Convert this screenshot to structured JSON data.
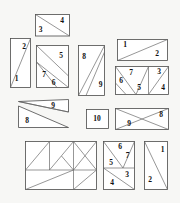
{
  "figure": {
    "background_color": "#f7f7f5",
    "piece_fill": "#ffffff",
    "piece_stroke": "#4a4a4a",
    "label_color": "#111111",
    "width": 180,
    "height": 203
  },
  "pieces": [
    {
      "id": "piece-3-4",
      "name": "rectangle-diagonal-3-4",
      "labels": [
        "3",
        "4"
      ],
      "label_positions": [
        {
          "x": 40,
          "y": 30
        },
        {
          "x": 62,
          "y": 21
        }
      ]
    },
    {
      "id": "piece-2-1",
      "name": "tall-rectangle-diagonal-2-1",
      "labels": [
        "2",
        "1"
      ],
      "label_positions": [
        {
          "x": 24,
          "y": 48
        },
        {
          "x": 16,
          "y": 80
        }
      ]
    },
    {
      "id": "piece-5-7-6",
      "name": "square-multi-cut-5-7-6",
      "labels": [
        "5",
        "7",
        "6"
      ],
      "label_positions": [
        {
          "x": 61,
          "y": 57
        },
        {
          "x": 44,
          "y": 75
        },
        {
          "x": 53,
          "y": 83
        }
      ]
    },
    {
      "id": "piece-8-9-tall",
      "name": "tall-rectangle-diagonal-8-9",
      "labels": [
        "8",
        "9"
      ],
      "label_positions": [
        {
          "x": 84,
          "y": 58
        },
        {
          "x": 101,
          "y": 85
        }
      ]
    },
    {
      "id": "piece-1-2-wide",
      "name": "wide-rectangle-diagonal-1-2",
      "labels": [
        "1",
        "2"
      ],
      "label_positions": [
        {
          "x": 125,
          "y": 45
        },
        {
          "x": 157,
          "y": 54
        }
      ]
    },
    {
      "id": "piece-6-7-5-3-4",
      "name": "wide-rectangle-multi-cut-6-7-5-3-4",
      "labels": [
        "7",
        "6",
        "5",
        "3",
        "4"
      ],
      "label_positions": [
        {
          "x": 131,
          "y": 73
        },
        {
          "x": 121,
          "y": 81
        },
        {
          "x": 139,
          "y": 88
        },
        {
          "x": 159,
          "y": 73
        },
        {
          "x": 163,
          "y": 88
        }
      ]
    },
    {
      "id": "piece-9-8-wide",
      "name": "wide-parallelogram-pair-9-8",
      "labels": [
        "9",
        "8"
      ],
      "label_positions": [
        {
          "x": 53,
          "y": 106
        },
        {
          "x": 27,
          "y": 122
        }
      ]
    },
    {
      "id": "piece-10",
      "name": "plain-rectangle-10",
      "labels": [
        "10"
      ],
      "label_positions": [
        {
          "x": 96,
          "y": 119
        }
      ]
    },
    {
      "id": "piece-9-8-cross",
      "name": "wide-rectangle-cross-9-8",
      "labels": [
        "9",
        "8"
      ],
      "label_positions": [
        {
          "x": 129,
          "y": 124
        },
        {
          "x": 161,
          "y": 116
        }
      ]
    },
    {
      "id": "piece-complex-large",
      "name": "large-unlabeled-composite",
      "labels": [],
      "label_positions": []
    },
    {
      "id": "piece-6-7-5-4-3",
      "name": "tall-rectangle-multi-cut-6-7-5-4-3",
      "labels": [
        "6",
        "7",
        "5",
        "4",
        "3"
      ],
      "label_positions": [
        {
          "x": 120,
          "y": 147
        },
        {
          "x": 127,
          "y": 156
        },
        {
          "x": 111,
          "y": 163
        },
        {
          "x": 112,
          "y": 183
        },
        {
          "x": 127,
          "y": 175
        }
      ]
    },
    {
      "id": "piece-1-2-tall",
      "name": "tall-rectangle-diagonal-1-2",
      "labels": [
        "1",
        "2"
      ],
      "label_positions": [
        {
          "x": 163,
          "y": 150
        },
        {
          "x": 150,
          "y": 180
        }
      ]
    }
  ],
  "labels": {
    "p34_a": "3",
    "p34_b": "4",
    "p21_a": "2",
    "p21_b": "1",
    "p576_a": "5",
    "p576_b": "7",
    "p576_c": "6",
    "p89t_a": "8",
    "p89t_b": "9",
    "p12w_a": "1",
    "p12w_b": "2",
    "p67534_a": "7",
    "p67534_b": "6",
    "p67534_c": "5",
    "p67534_d": "3",
    "p67534_e": "4",
    "p98w_a": "9",
    "p98w_b": "8",
    "p10_a": "10",
    "p98c_a": "9",
    "p98c_b": "8",
    "p67543_a": "6",
    "p67543_b": "7",
    "p67543_c": "5",
    "p67543_d": "4",
    "p67543_e": "3",
    "p12t_a": "1",
    "p12t_b": "2"
  }
}
